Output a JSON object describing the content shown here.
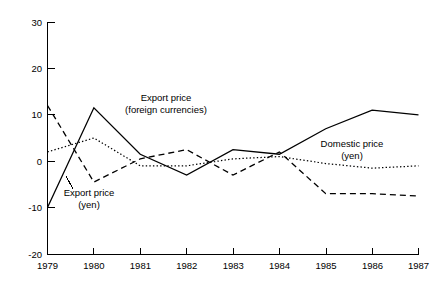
{
  "chart_data": {
    "type": "line",
    "title": "",
    "subtitle": "",
    "xlabel": "",
    "ylabel": "",
    "x": [
      1979,
      1980,
      1981,
      1982,
      1983,
      1984,
      1985,
      1986,
      1987
    ],
    "categories": [
      "1979",
      "1980",
      "1981",
      "1982",
      "1983",
      "1984",
      "1985",
      "1986",
      "1987"
    ],
    "xlim": [
      1979,
      1987
    ],
    "ylim": [
      -20,
      30
    ],
    "yticks": [
      30,
      20,
      10,
      0,
      -10,
      -20
    ],
    "ytick_labels": [
      "30",
      "20",
      "10",
      "0",
      "-10",
      "-20"
    ],
    "xticks": [
      1979,
      1980,
      1981,
      1982,
      1983,
      1984,
      1985,
      1986,
      1987
    ],
    "xtick_labels": [
      "1979",
      "1980",
      "1981",
      "1982",
      "1983",
      "1984",
      "1985",
      "1986",
      "1987"
    ],
    "grid": false,
    "legend_position": "inline-annotations",
    "series": [
      {
        "name": "Export price (foreign currencies)",
        "style": "solid",
        "values": [
          -10,
          11.5,
          1.5,
          -3,
          2.5,
          1.5,
          7,
          11,
          10
        ]
      },
      {
        "name": "Export price (yen)",
        "style": "dashed",
        "values": [
          12,
          -4.5,
          0.5,
          2.5,
          -3,
          2,
          -7,
          -7,
          -7.5
        ]
      },
      {
        "name": "Domestic price (yen)",
        "style": "dotted",
        "values": [
          2,
          5,
          -1,
          -1,
          0.5,
          1,
          -0.5,
          -1.5,
          -1
        ]
      }
    ],
    "annotations": [
      {
        "id": "export-foreign",
        "line1": "Export price",
        "line2": "(foreign currencies)",
        "x": 166,
        "y": 101
      },
      {
        "id": "export-yen",
        "line1": "Export price",
        "line2": "(yen)",
        "x": 89,
        "y": 196
      },
      {
        "id": "domestic-yen",
        "line1": "Domestic price",
        "line2": "(yen)",
        "x": 352,
        "y": 147
      }
    ]
  },
  "axes": {
    "ytick_0": "30",
    "ytick_1": "20",
    "ytick_2": "10",
    "ytick_3": "0",
    "ytick_4": "-10",
    "ytick_5": "-20",
    "xtick_0": "1979",
    "xtick_1": "1980",
    "xtick_2": "1981",
    "xtick_3": "1982",
    "xtick_4": "1983",
    "xtick_5": "1984",
    "xtick_6": "1985",
    "xtick_7": "1986",
    "xtick_8": "1987"
  },
  "annotations": {
    "export_foreign_l1": "Export price",
    "export_foreign_l2": "(foreign currencies)",
    "export_yen_l1": "Export price",
    "export_yen_l2": "(yen)",
    "domestic_yen_l1": "Domestic price",
    "domestic_yen_l2": "(yen)"
  },
  "colors": {
    "background": "#ffffff",
    "foreground": "#000000"
  }
}
